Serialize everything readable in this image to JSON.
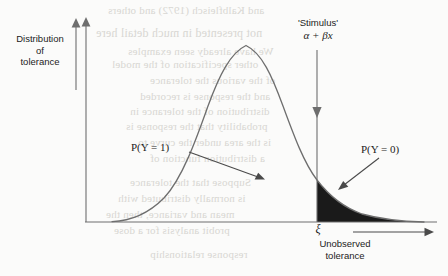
{
  "figure": {
    "type": "statistical-diagram"
  },
  "labels": {
    "y_axis_title": "Distribution\nof\ntolerance",
    "y_axis_title_line1": "Distribution",
    "y_axis_title_line2": "of",
    "y_axis_title_line3": "tolerance",
    "stimulus": "'Stimulus'",
    "stimulus_formula": "α + βx",
    "prob_y1": "P(Y = 1)",
    "prob_y0": "P(Y = 0)",
    "threshold_symbol": "ξ",
    "unobserved_line1": "Unobserved",
    "unobserved_line2": "tolerance"
  },
  "colors": {
    "page_background": "#fbfbfa",
    "ink": "#1b1b1b",
    "curve_line": "#6e6e6e",
    "axis_line": "#6e6e6e",
    "shaded_tail": "#1a1a1a",
    "bleed_through": "#cdcbc6"
  },
  "chart_data": {
    "type": "area",
    "title": "",
    "xlabel": "Unobserved tolerance",
    "ylabel": "Distribution of tolerance",
    "grid": false,
    "legend": "none",
    "axis": {
      "x_start_px": 85,
      "x_end_px": 437,
      "baseline_y_px": 222,
      "y_axis_x_px": 86,
      "y_top_px": 20
    },
    "curve": {
      "name": "tolerance density",
      "shape": "skewed bell curve",
      "peak_x_px": 246,
      "peak_y_px": 45,
      "left_tail_meets_axis_px": 118,
      "right_tail_end_px": 424
    },
    "threshold": {
      "label": "ξ",
      "x_px": 317,
      "curve_y_at_threshold_px": 180,
      "meaning": "stimulus level alpha + beta x"
    },
    "regions": [
      {
        "name": "P(Y = 1)",
        "side": "left of threshold",
        "fill": "none",
        "annotation_arrow": "points down-right into curve body"
      },
      {
        "name": "P(Y = 0)",
        "side": "right of threshold",
        "fill": "solid dark",
        "annotation_arrow": "points down-left into shaded tail"
      }
    ]
  },
  "bleed_through_text": [
    {
      "text": "and Kalbfleisch (1972) and others",
      "x": 108,
      "y": 4,
      "size": 11
    },
    {
      "text": "not presented in much detail here",
      "x": 96,
      "y": 26,
      "size": 12
    },
    {
      "text": "We have already seen examples",
      "x": 128,
      "y": 45,
      "size": 11
    },
    {
      "text": "other specification of the model",
      "x": 112,
      "y": 58,
      "size": 11
    },
    {
      "text": "of the various the tolerance",
      "x": 150,
      "y": 74,
      "size": 11
    },
    {
      "text": "and the response is recorded",
      "x": 140,
      "y": 90,
      "size": 11
    },
    {
      "text": "distribution of the tolerance in",
      "x": 130,
      "y": 105,
      "size": 11
    },
    {
      "text": "probability that the response is",
      "x": 126,
      "y": 120,
      "size": 11
    },
    {
      "text": "is the area under the curve to",
      "x": 138,
      "y": 136,
      "size": 11
    },
    {
      "text": "a distribution function of",
      "x": 150,
      "y": 152,
      "size": 11
    },
    {
      "text": "Suppose that the tolerance",
      "x": 130,
      "y": 176,
      "size": 11
    },
    {
      "text": "is normally distributed with",
      "x": 118,
      "y": 192,
      "size": 11
    },
    {
      "text": "mean and variance, then the",
      "x": 106,
      "y": 208,
      "size": 11
    },
    {
      "text": "probit analysis for a dose",
      "x": 114,
      "y": 224,
      "size": 11
    },
    {
      "text": "response relationship",
      "x": 150,
      "y": 248,
      "size": 11
    }
  ]
}
